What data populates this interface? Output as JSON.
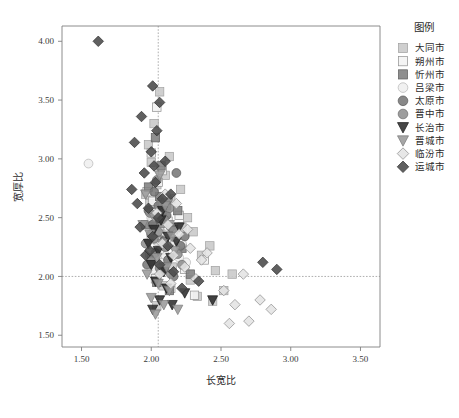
{
  "figure": {
    "background": "#ffffff",
    "axis_color": "#808080",
    "refline_color": "#9a9a9a"
  },
  "axes": {
    "x_title": "长宽比",
    "y_title": "宽厚比",
    "x_ticks": [
      "1.50",
      "2.00",
      "2.50",
      "3.00",
      "3.50"
    ],
    "y_ticks": [
      "1.50",
      "2.00",
      "2.50",
      "3.00",
      "3.50",
      "4.00"
    ],
    "x_tick_values": [
      1.5,
      2.0,
      2.5,
      3.0,
      3.5
    ],
    "y_tick_values": [
      1.5,
      2.0,
      2.5,
      3.0,
      3.5,
      4.0
    ],
    "xlim": [
      1.36,
      3.64
    ],
    "ylim": [
      1.4,
      4.13
    ],
    "reference_lines": {
      "vertical_x": 2.05,
      "horizontal_y": 2.0
    }
  },
  "legend": {
    "title": "图例",
    "position": "right",
    "items": [
      {
        "label": "大同市",
        "marker": "square",
        "fill": "#c8c8c8",
        "edge": "#a0a0a0"
      },
      {
        "label": "朔州市",
        "marker": "square",
        "fill": "#f2f2f2",
        "edge": "#8f8f8f"
      },
      {
        "label": "忻州市",
        "marker": "square",
        "fill": "#808080",
        "edge": "#5e5e5e"
      },
      {
        "label": "吕梁市",
        "marker": "circle",
        "fill": "#efefef",
        "edge": "#b4b4b4"
      },
      {
        "label": "太原市",
        "marker": "circle",
        "fill": "#787878",
        "edge": "#565656"
      },
      {
        "label": "晋中市",
        "marker": "circle",
        "fill": "#909090",
        "edge": "#6a6a6a"
      },
      {
        "label": "长治市",
        "marker": "triangle-down",
        "fill": "#2e2e2e",
        "edge": "#1a1a1a"
      },
      {
        "label": "晋城市",
        "marker": "triangle-down",
        "fill": "#9a9a9a",
        "edge": "#787878"
      },
      {
        "label": "临汾市",
        "marker": "diamond",
        "fill": "#e4e4e4",
        "edge": "#8a8a8a"
      },
      {
        "label": "运城市",
        "marker": "diamond",
        "fill": "#4a4a4a",
        "edge": "#2e2e2e"
      }
    ]
  },
  "chart_data": {
    "type": "scatter",
    "title": "",
    "xlabel": "长宽比",
    "ylabel": "宽厚比",
    "xlim": [
      1.36,
      3.64
    ],
    "ylim": [
      1.4,
      4.13
    ],
    "grid": false,
    "legend_position": "right",
    "annotations": [
      {
        "type": "vline",
        "x": 2.05
      },
      {
        "type": "hline",
        "y": 2.0
      }
    ],
    "series": [
      {
        "name": "大同市",
        "marker": "square",
        "fill": "#c8c8c8",
        "edge": "#a0a0a0",
        "points": [
          [
            2.06,
            3.57
          ],
          [
            2.02,
            3.3
          ],
          [
            1.98,
            3.12
          ],
          [
            2.0,
            2.97
          ],
          [
            2.1,
            2.86
          ],
          [
            2.04,
            2.78
          ],
          [
            2.21,
            2.74
          ],
          [
            2.14,
            2.66
          ],
          [
            1.99,
            2.62
          ],
          [
            2.08,
            2.55
          ],
          [
            2.26,
            2.5
          ],
          [
            2.03,
            2.46
          ],
          [
            2.12,
            2.41
          ],
          [
            2.3,
            2.38
          ],
          [
            2.0,
            2.34
          ],
          [
            2.18,
            2.3
          ],
          [
            2.42,
            2.26
          ],
          [
            2.07,
            2.22
          ],
          [
            2.36,
            2.18
          ],
          [
            2.02,
            2.14
          ],
          [
            2.46,
            2.05
          ],
          [
            2.58,
            2.02
          ],
          [
            2.28,
            1.97
          ],
          [
            2.09,
            1.92
          ],
          [
            2.52,
            1.88
          ],
          [
            2.33,
            1.83
          ],
          [
            2.44,
            1.79
          ],
          [
            2.04,
            1.75
          ],
          [
            2.15,
            2.08
          ],
          [
            2.22,
            2.42
          ],
          [
            1.96,
            2.7
          ],
          [
            2.13,
            3.02
          ]
        ]
      },
      {
        "name": "朔州市",
        "marker": "square",
        "fill": "#f2f2f2",
        "edge": "#8f8f8f",
        "points": [
          [
            2.04,
            3.44
          ],
          [
            2.0,
            3.05
          ],
          [
            2.08,
            2.9
          ],
          [
            1.97,
            2.72
          ],
          [
            2.02,
            2.58
          ],
          [
            2.12,
            2.47
          ],
          [
            2.06,
            2.36
          ],
          [
            2.17,
            2.28
          ],
          [
            1.99,
            2.2
          ],
          [
            2.09,
            2.12
          ],
          [
            2.24,
            2.06
          ],
          [
            2.03,
            1.98
          ],
          [
            2.14,
            1.9
          ],
          [
            2.31,
            1.84
          ],
          [
            2.01,
            2.64
          ],
          [
            2.2,
            2.52
          ],
          [
            2.38,
            2.14
          ],
          [
            2.05,
            2.8
          ]
        ]
      },
      {
        "name": "忻州市",
        "marker": "square",
        "fill": "#808080",
        "edge": "#5e5e5e",
        "points": [
          [
            2.03,
            3.18
          ],
          [
            2.07,
            2.94
          ],
          [
            1.98,
            2.76
          ],
          [
            2.11,
            2.6
          ],
          [
            2.01,
            2.49
          ],
          [
            2.16,
            2.4
          ],
          [
            2.05,
            2.31
          ],
          [
            2.22,
            2.24
          ],
          [
            2.0,
            2.16
          ],
          [
            2.09,
            2.08
          ],
          [
            2.28,
            2.02
          ],
          [
            2.04,
            1.95
          ],
          [
            2.13,
            1.88
          ],
          [
            1.96,
            2.44
          ],
          [
            2.19,
            2.56
          ],
          [
            2.06,
            2.68
          ]
        ]
      },
      {
        "name": "吕梁市",
        "marker": "circle",
        "fill": "#efefef",
        "edge": "#b4b4b4",
        "points": [
          [
            1.55,
            2.96
          ],
          [
            2.08,
            2.46
          ],
          [
            2.14,
            2.38
          ],
          [
            2.04,
            2.3
          ],
          [
            2.18,
            2.24
          ],
          [
            2.1,
            2.18
          ],
          [
            2.25,
            2.12
          ],
          [
            2.02,
            2.06
          ],
          [
            2.16,
            2.34
          ],
          [
            2.22,
            2.28
          ],
          [
            2.06,
            2.22
          ],
          [
            2.12,
            2.42
          ],
          [
            2.2,
            2.16
          ],
          [
            2.0,
            2.5
          ]
        ]
      },
      {
        "name": "太原市",
        "marker": "circle",
        "fill": "#787878",
        "edge": "#565656",
        "points": [
          [
            2.18,
            2.88
          ],
          [
            2.02,
            2.72
          ],
          [
            2.1,
            2.64
          ],
          [
            1.98,
            2.56
          ],
          [
            2.06,
            2.48
          ],
          [
            2.14,
            2.42
          ],
          [
            2.0,
            2.36
          ],
          [
            2.09,
            2.3
          ],
          [
            2.21,
            2.26
          ],
          [
            2.03,
            2.2
          ],
          [
            2.12,
            2.14
          ],
          [
            1.97,
            2.1
          ],
          [
            2.07,
            2.04
          ],
          [
            2.16,
            2.0
          ],
          [
            2.01,
            2.44
          ],
          [
            2.11,
            2.52
          ],
          [
            2.05,
            2.6
          ],
          [
            2.24,
            2.34
          ]
        ]
      },
      {
        "name": "晋中市",
        "marker": "circle",
        "fill": "#909090",
        "edge": "#6a6a6a",
        "points": [
          [
            2.04,
            2.82
          ],
          [
            2.12,
            2.66
          ],
          [
            1.99,
            2.54
          ],
          [
            2.08,
            2.45
          ],
          [
            2.16,
            2.39
          ],
          [
            2.02,
            2.32
          ],
          [
            2.1,
            2.25
          ],
          [
            2.19,
            2.19
          ],
          [
            2.0,
            2.13
          ],
          [
            2.06,
            2.07
          ],
          [
            2.14,
            2.02
          ],
          [
            1.96,
            2.28
          ],
          [
            2.22,
            2.1
          ],
          [
            2.05,
            2.38
          ],
          [
            2.13,
            2.58
          ],
          [
            2.09,
            2.49
          ]
        ]
      },
      {
        "name": "长治市",
        "marker": "triangle-down",
        "fill": "#2e2e2e",
        "edge": "#1a1a1a",
        "points": [
          [
            2.07,
            2.48
          ],
          [
            2.02,
            2.4
          ],
          [
            2.12,
            2.34
          ],
          [
            1.98,
            2.28
          ],
          [
            2.05,
            2.22
          ],
          [
            2.14,
            2.16
          ],
          [
            2.0,
            2.1
          ],
          [
            2.09,
            2.04
          ],
          [
            2.18,
            2.3
          ],
          [
            2.03,
            1.96
          ],
          [
            2.11,
            1.9
          ],
          [
            2.24,
            1.86
          ],
          [
            2.06,
            1.8
          ],
          [
            2.15,
            1.76
          ],
          [
            2.01,
            1.72
          ],
          [
            2.44,
            1.8
          ],
          [
            2.2,
            2.42
          ],
          [
            2.08,
            2.56
          ]
        ]
      },
      {
        "name": "晋城市",
        "marker": "triangle-down",
        "fill": "#9a9a9a",
        "edge": "#787878",
        "points": [
          [
            2.06,
            2.86
          ],
          [
            1.96,
            2.7
          ],
          [
            2.1,
            2.6
          ],
          [
            2.02,
            2.5
          ],
          [
            2.13,
            2.44
          ],
          [
            1.99,
            2.36
          ],
          [
            2.08,
            2.28
          ],
          [
            2.17,
            2.22
          ],
          [
            2.04,
            2.16
          ],
          [
            2.11,
            2.08
          ],
          [
            1.97,
            2.02
          ],
          [
            2.05,
            1.94
          ],
          [
            2.13,
            1.88
          ],
          [
            2.0,
            1.82
          ],
          [
            2.09,
            1.76
          ],
          [
            2.19,
            1.72
          ],
          [
            2.03,
            1.68
          ],
          [
            1.94,
            2.44
          ],
          [
            2.15,
            2.34
          ]
        ]
      },
      {
        "name": "临汾市",
        "marker": "diamond",
        "fill": "#e4e4e4",
        "edge": "#8a8a8a",
        "points": [
          [
            2.04,
            2.54
          ],
          [
            2.12,
            2.44
          ],
          [
            2.2,
            2.36
          ],
          [
            2.08,
            2.28
          ],
          [
            2.28,
            2.24
          ],
          [
            2.16,
            2.18
          ],
          [
            2.36,
            2.14
          ],
          [
            2.24,
            2.08
          ],
          [
            2.06,
            2.02
          ],
          [
            2.32,
            1.98
          ],
          [
            2.14,
            1.94
          ],
          [
            2.66,
            2.02
          ],
          [
            2.52,
            1.88
          ],
          [
            2.78,
            1.8
          ],
          [
            2.6,
            1.76
          ],
          [
            2.86,
            1.72
          ],
          [
            2.7,
            1.62
          ],
          [
            2.56,
            1.6
          ],
          [
            2.18,
            2.62
          ],
          [
            2.1,
            2.7
          ],
          [
            2.26,
            2.4
          ],
          [
            2.4,
            2.2
          ]
        ]
      },
      {
        "name": "运城市",
        "marker": "diamond",
        "fill": "#4a4a4a",
        "edge": "#2e2e2e",
        "points": [
          [
            1.62,
            4.0
          ],
          [
            2.01,
            3.62
          ],
          [
            2.06,
            3.48
          ],
          [
            1.93,
            3.36
          ],
          [
            2.04,
            3.24
          ],
          [
            1.88,
            3.14
          ],
          [
            2.0,
            3.06
          ],
          [
            2.1,
            2.98
          ],
          [
            1.95,
            2.88
          ],
          [
            2.03,
            2.8
          ],
          [
            1.86,
            2.74
          ],
          [
            2.08,
            2.66
          ],
          [
            1.98,
            2.58
          ],
          [
            2.05,
            2.5
          ],
          [
            1.92,
            2.42
          ],
          [
            2.01,
            2.34
          ],
          [
            2.12,
            2.26
          ],
          [
            1.96,
            2.18
          ],
          [
            2.06,
            2.1
          ],
          [
            2.16,
            2.04
          ],
          [
            2.34,
            1.96
          ],
          [
            2.22,
            1.9
          ],
          [
            2.9,
            2.06
          ],
          [
            2.8,
            2.12
          ],
          [
            2.02,
            2.94
          ],
          [
            1.9,
            2.62
          ],
          [
            2.14,
            2.7
          ],
          [
            1.99,
            2.22
          ]
        ]
      }
    ]
  }
}
